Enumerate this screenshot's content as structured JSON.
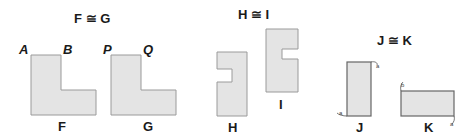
{
  "figures": [
    {
      "id": "FG",
      "title": "F ≅ G",
      "shapes": [
        {
          "name": "F",
          "label": "F",
          "vertices": [
            "A",
            "B"
          ]
        },
        {
          "name": "G",
          "label": "G",
          "vertices": [
            "P",
            "Q"
          ]
        }
      ]
    },
    {
      "id": "HI",
      "title": "H ≅ I",
      "shapes": [
        {
          "name": "H",
          "label": "H"
        },
        {
          "name": "I",
          "label": "I"
        }
      ]
    },
    {
      "id": "JK",
      "title": "J ≅ K",
      "shapes": [
        {
          "name": "J",
          "label": "J",
          "marks": [
            "a",
            "a"
          ]
        },
        {
          "name": "K",
          "label": "K",
          "marks": [
            "b",
            "a"
          ]
        }
      ]
    }
  ],
  "colors": {
    "fill": "#e4e4e4",
    "stroke": "#9a9a9a",
    "text": "#1a1a1a",
    "dark_stroke": "#666666"
  }
}
